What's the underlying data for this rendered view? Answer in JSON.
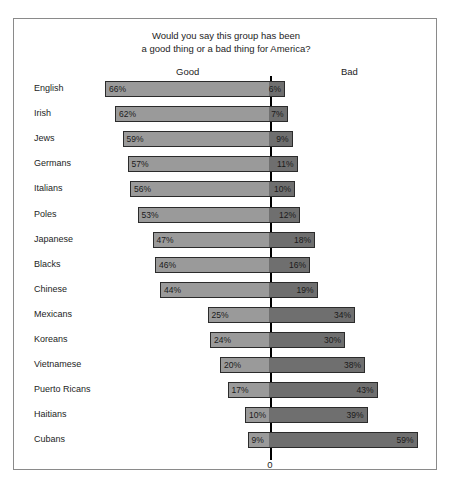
{
  "title": {
    "line1": "Would you say this group has been",
    "line2": "a good thing or a bad thing for America?"
  },
  "headers": {
    "good": "Good",
    "bad": "Bad"
  },
  "axis": {
    "zero_label": "0"
  },
  "chart_data": {
    "type": "bar",
    "title": "Would you say this group has been a good thing or a bad thing for America?",
    "subtitle": "",
    "xlabel": "",
    "ylabel": "",
    "orientation": "horizontal",
    "layout": "diverging",
    "grid": false,
    "legend_position": "top",
    "axis_zero_label": "0",
    "px_per_percent": 2.5,
    "colors": {
      "good": "#9a9a9a",
      "bad": "#6f6f6f",
      "bar_border": "#2b2b2b",
      "zero_line": "#000000",
      "frame": "#8a8a8a"
    },
    "categories": [
      "English",
      "Irish",
      "Jews",
      "Germans",
      "Italians",
      "Poles",
      "Japanese",
      "Blacks",
      "Chinese",
      "Mexicans",
      "Koreans",
      "Vietnamese",
      "Puerto Ricans",
      "Haitians",
      "Cubans"
    ],
    "series": [
      {
        "name": "Good",
        "values": [
          66,
          62,
          59,
          57,
          56,
          53,
          47,
          46,
          44,
          25,
          24,
          20,
          17,
          10,
          9
        ]
      },
      {
        "name": "Bad",
        "values": [
          6,
          7,
          9,
          11,
          10,
          12,
          18,
          16,
          19,
          34,
          30,
          38,
          43,
          39,
          59
        ]
      }
    ],
    "rows": [
      {
        "group": "English",
        "good": 66,
        "bad": 6,
        "good_label": "66%",
        "bad_label": "6%"
      },
      {
        "group": "Irish",
        "good": 62,
        "bad": 7,
        "good_label": "62%",
        "bad_label": "7%"
      },
      {
        "group": "Jews",
        "good": 59,
        "bad": 9,
        "good_label": "59%",
        "bad_label": "9%"
      },
      {
        "group": "Germans",
        "good": 57,
        "bad": 11,
        "good_label": "57%",
        "bad_label": "11%"
      },
      {
        "group": "Italians",
        "good": 56,
        "bad": 10,
        "good_label": "56%",
        "bad_label": "10%"
      },
      {
        "group": "Poles",
        "good": 53,
        "bad": 12,
        "good_label": "53%",
        "bad_label": "12%"
      },
      {
        "group": "Japanese",
        "good": 47,
        "bad": 18,
        "good_label": "47%",
        "bad_label": "18%"
      },
      {
        "group": "Blacks",
        "good": 46,
        "bad": 16,
        "good_label": "46%",
        "bad_label": "16%"
      },
      {
        "group": "Chinese",
        "good": 44,
        "bad": 19,
        "good_label": "44%",
        "bad_label": "19%"
      },
      {
        "group": "Mexicans",
        "good": 25,
        "bad": 34,
        "good_label": "25%",
        "bad_label": "34%"
      },
      {
        "group": "Koreans",
        "good": 24,
        "bad": 30,
        "good_label": "24%",
        "bad_label": "30%"
      },
      {
        "group": "Vietnamese",
        "good": 20,
        "bad": 38,
        "good_label": "20%",
        "bad_label": "38%"
      },
      {
        "group": "Puerto Ricans",
        "good": 17,
        "bad": 43,
        "good_label": "17%",
        "bad_label": "43%"
      },
      {
        "group": "Haitians",
        "good": 10,
        "bad": 39,
        "good_label": "10%",
        "bad_label": "39%"
      },
      {
        "group": "Cubans",
        "good": 9,
        "bad": 59,
        "good_label": "9%",
        "bad_label": "59%"
      }
    ]
  }
}
